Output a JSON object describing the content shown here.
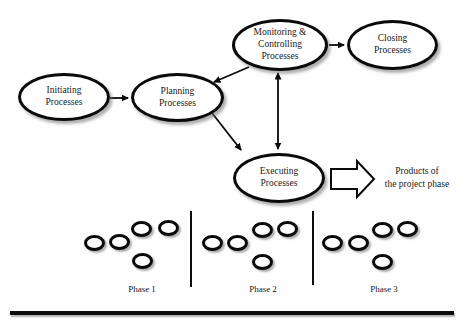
{
  "diagram": {
    "nodes": {
      "initiating": {
        "label": "Initiating\nProcesses"
      },
      "planning": {
        "label": "Planning\nProcesses"
      },
      "monitoring": {
        "label": "Monitoring &\nControlling\nProcesses"
      },
      "closing": {
        "label": "Closing\nProcesses"
      },
      "executing": {
        "label": "Executing\nProcesses"
      }
    },
    "connections": [
      {
        "from": "initiating",
        "to": "planning",
        "type": "arrow"
      },
      {
        "from": "monitoring",
        "to": "planning",
        "type": "arrow"
      },
      {
        "from": "planning",
        "to": "executing",
        "type": "arrow"
      },
      {
        "from": "monitoring",
        "to": "executing",
        "type": "double-arrow"
      },
      {
        "from": "monitoring",
        "to": "closing",
        "type": "arrow"
      },
      {
        "from": "executing",
        "to": "products-of-the-project-phase",
        "type": "block-arrow"
      }
    ],
    "output_label": "Products of\nthe project phase"
  },
  "phases": {
    "items": [
      {
        "label": "Phase 1",
        "ellipse_count": 5
      },
      {
        "label": "Phase 2",
        "ellipse_count": 5
      },
      {
        "label": "Phase 3",
        "ellipse_count": 5
      }
    ]
  },
  "colors": {
    "stroke": "#0a0a0a",
    "background": "#ffffff"
  }
}
